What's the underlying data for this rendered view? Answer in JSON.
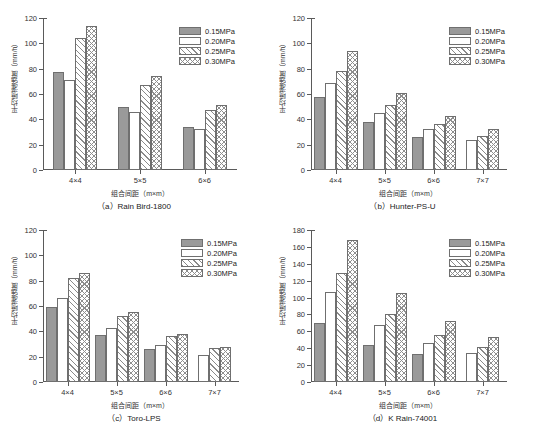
{
  "figure": {
    "series_names": [
      "0.15MPa",
      "0.20MPa",
      "0.25MPa",
      "0.30MPa"
    ],
    "xlabel": "组合间距（m×m）",
    "ylabel": "平均喷灌强度（mm/h）"
  },
  "chart_data": [
    {
      "type": "bar",
      "title": "（a）Rain Bird-1800",
      "panel": "a",
      "xlabel": "组合间距（m×m）",
      "ylabel": "平均喷灌强度（mm/h）",
      "categories": [
        "4×4",
        "5×5",
        "6×6"
      ],
      "yticks": [
        0,
        20,
        40,
        60,
        80,
        100,
        120
      ],
      "ylim": [
        0,
        120
      ],
      "grid": false,
      "legend_position": "top-right",
      "series": [
        {
          "name": "0.15MPa",
          "values": [
            77,
            50,
            34
          ]
        },
        {
          "name": "0.20MPa",
          "values": [
            71,
            46,
            32
          ]
        },
        {
          "name": "0.25MPa",
          "values": [
            104,
            67,
            47
          ]
        },
        {
          "name": "0.30MPa",
          "values": [
            114,
            74,
            51
          ]
        }
      ]
    },
    {
      "type": "bar",
      "title": "（b）Hunter-PS-U",
      "panel": "b",
      "xlabel": "组合间距（m×m）",
      "ylabel": "平均喷灌强度（mm/h）",
      "categories": [
        "4×4",
        "5×5",
        "6×6",
        "7×7"
      ],
      "yticks": [
        0,
        20,
        40,
        60,
        80,
        100,
        120
      ],
      "ylim": [
        0,
        120
      ],
      "grid": false,
      "legend_position": "top-right",
      "series": [
        {
          "name": "0.15MPa",
          "values": [
            58,
            38,
            26,
            null
          ]
        },
        {
          "name": "0.20MPa",
          "values": [
            69,
            45,
            32,
            24
          ]
        },
        {
          "name": "0.25MPa",
          "values": [
            78,
            51,
            36,
            27
          ]
        },
        {
          "name": "0.30MPa",
          "values": [
            94,
            61,
            43,
            32
          ]
        }
      ]
    },
    {
      "type": "bar",
      "title": "（c）Toro-LPS",
      "panel": "c",
      "xlabel": "组合间距（m×m）",
      "ylabel": "平均喷灌强度（mm/h）",
      "categories": [
        "4×4",
        "5×5",
        "6×6",
        "7×7"
      ],
      "yticks": [
        0,
        20,
        40,
        60,
        80,
        100,
        120
      ],
      "ylim": [
        0,
        120
      ],
      "grid": false,
      "legend_position": "top-right",
      "series": [
        {
          "name": "0.15MPa",
          "values": [
            59,
            37,
            26,
            null
          ]
        },
        {
          "name": "0.20MPa",
          "values": [
            66,
            43,
            29,
            21
          ]
        },
        {
          "name": "0.25MPa",
          "values": [
            82,
            52,
            36,
            27
          ]
        },
        {
          "name": "0.30MPa",
          "values": [
            86,
            55,
            38,
            28
          ]
        }
      ]
    },
    {
      "type": "bar",
      "title": "（d）K Rain-74001",
      "panel": "d",
      "xlabel": "组合间距（m×m）",
      "ylabel": "平均喷灌强度（mm/h）",
      "categories": [
        "4×4",
        "5×5",
        "6×6",
        "7×7"
      ],
      "yticks": [
        0,
        20,
        40,
        60,
        80,
        100,
        120,
        140,
        160,
        180
      ],
      "ylim": [
        0,
        180
      ],
      "grid": false,
      "legend_position": "top-right",
      "series": [
        {
          "name": "0.15MPa",
          "values": [
            70,
            44,
            33,
            null
          ]
        },
        {
          "name": "0.20MPa",
          "values": [
            107,
            68,
            46,
            34
          ]
        },
        {
          "name": "0.25MPa",
          "values": [
            129,
            81,
            56,
            41
          ]
        },
        {
          "name": "0.30MPa",
          "values": [
            168,
            105,
            72,
            53
          ]
        }
      ]
    }
  ]
}
